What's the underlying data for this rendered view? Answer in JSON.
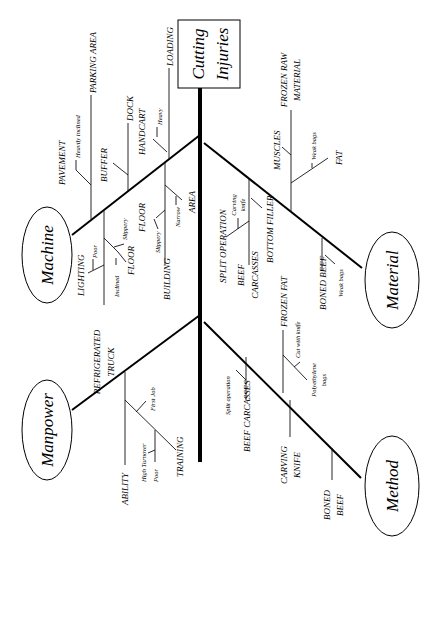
{
  "effect": {
    "line1": "Cutting",
    "line2": "Injuries"
  },
  "categories": {
    "machine": "Machine",
    "material": "Material",
    "manpower": "Manpower",
    "method": "Method"
  },
  "machine": {
    "loading": "LOADING",
    "dock": "DOCK",
    "parking_area": "PARKING AREA",
    "heavily_inclined": "Heavily inclined",
    "pavement": "PAVEMENT",
    "buffer": "BUFFER",
    "handcart": "HANDCART",
    "heavy": "Heavy",
    "lighting": "LIGHTING",
    "poor": "Poor",
    "floor1": "FLOOR",
    "slippery1": "Slippery",
    "inclined": "Inclined",
    "floor2": "FLOOR",
    "slippery2": "Slippery",
    "building": "BUILDING",
    "area": "AREA",
    "narrow": "Narrow",
    "refrigerated_truck_1": "REFRIGERATED",
    "refrigerated_truck_2": "TRUCK"
  },
  "material": {
    "frozen_raw_1": "FROZEN RAW",
    "frozen_raw_2": "MATERIAL",
    "muscles": "MUSCLES",
    "weak_bags1": "Weak bags",
    "fat": "FAT",
    "split_operation": "SPLIT OPERATION",
    "carving_knife_1": "Carving",
    "carving_knife_2": "knife",
    "beef_carcasses_1": "BEEF",
    "beef_carcasses_2": "CARCASSES",
    "bottom_filler": "BOTTOM FILLER",
    "boned_beef": "BONED BEEF",
    "weak_bags2": "Weak bags"
  },
  "manpower": {
    "ability": "ABILITY",
    "first_job": "First Job",
    "high_turnover": "High Turnover",
    "poor": "Poor",
    "training": "TRAINING"
  },
  "method": {
    "split_operation": "Split operation",
    "beef_carcasses": "BEEF CARCASSES",
    "frozen_fat": "FROZEN FAT",
    "cut_with_knife": "Cut with knife",
    "polyethylene_1": "Polyethylene",
    "polyethylene_2": "bags",
    "carving_knife_1": "CARVING",
    "carving_knife_2": "KNIFE",
    "boned_beef_1": "BONED",
    "boned_beef_2": "BEEF"
  }
}
